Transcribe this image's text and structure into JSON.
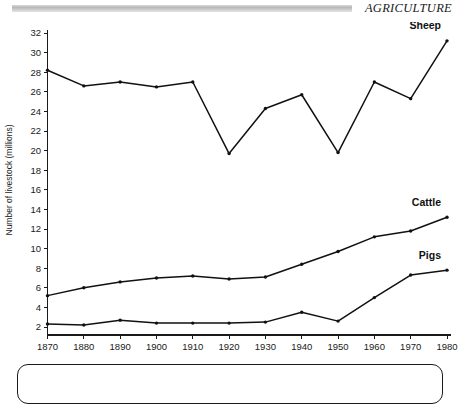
{
  "header": {
    "title": "AGRICULTURE",
    "rule_icon": "horizontal-rule-icon"
  },
  "chart_data": {
    "type": "line",
    "title": "",
    "xlabel": "",
    "ylabel": "Number of livestock (millions)",
    "x": [
      1870,
      1880,
      1890,
      1900,
      1910,
      1920,
      1930,
      1940,
      1950,
      1960,
      1970,
      1980
    ],
    "xtick_labels": [
      "1870",
      "1880",
      "1890",
      "1900",
      "1910",
      "1920",
      "1930",
      "1940",
      "1950",
      "1960",
      "1970",
      "1980"
    ],
    "ytick_labels": [
      "2",
      "4",
      "6",
      "8",
      "10",
      "12",
      "14",
      "16",
      "18",
      "20",
      "22",
      "24",
      "26",
      "28",
      "30",
      "32"
    ],
    "yticks": [
      2,
      4,
      6,
      8,
      10,
      12,
      14,
      16,
      18,
      20,
      22,
      24,
      26,
      28,
      30,
      32
    ],
    "xlim": [
      1868,
      1982
    ],
    "ylim": [
      1.2,
      32.6
    ],
    "grid": false,
    "legend": "inline-end-labels",
    "series": [
      {
        "name": "Sheep",
        "label": "Sheep",
        "color": "#111111",
        "values": [
          28.2,
          26.6,
          27.0,
          26.5,
          27.0,
          19.7,
          24.3,
          25.7,
          19.8,
          27.0,
          25.3,
          31.2
        ]
      },
      {
        "name": "Cattle",
        "label": "Cattle",
        "color": "#111111",
        "values": [
          5.2,
          6.0,
          6.6,
          7.0,
          7.2,
          6.9,
          7.1,
          8.4,
          9.7,
          11.2,
          11.8,
          13.2
        ]
      },
      {
        "name": "Pigs",
        "label": "Pigs",
        "color": "#111111",
        "values": [
          2.3,
          2.2,
          2.7,
          2.4,
          2.4,
          2.4,
          2.5,
          3.5,
          2.6,
          5.0,
          7.3,
          7.8
        ]
      }
    ]
  },
  "caption": {
    "text": ""
  }
}
